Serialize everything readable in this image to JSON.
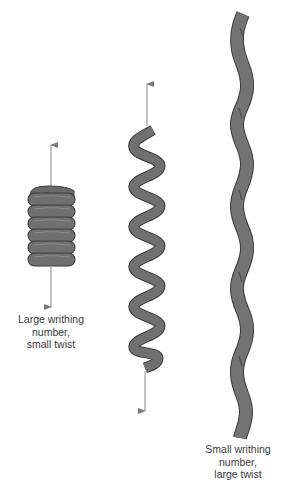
{
  "figure": {
    "colors": {
      "ribbon_fill": "#707070",
      "ribbon_outline": "#3c3c3c",
      "arrow": "#8a8a8a",
      "text": "#3a3a3a",
      "background": "#ffffff"
    },
    "structures": [
      {
        "name": "solenoidal-coil",
        "label_lines": [
          "Large writhing",
          "number,",
          "small twist"
        ],
        "turns": 6,
        "has_arrows": true
      },
      {
        "name": "plectonemic-helix",
        "label_lines": [],
        "turns": 6,
        "has_arrows": true
      },
      {
        "name": "twisted-ribbon",
        "label_lines": [
          "Small writhing",
          "number,",
          "large twist"
        ],
        "turns": 5,
        "has_arrows": false
      }
    ]
  }
}
